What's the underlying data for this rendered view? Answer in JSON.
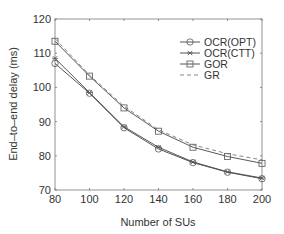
{
  "chart_data": {
    "type": "line",
    "title": "",
    "xlabel": "Number of SUs",
    "ylabel": "End–to–end delay (ms)",
    "x": [
      80,
      100,
      120,
      140,
      160,
      180,
      200
    ],
    "xlim": [
      80,
      200
    ],
    "ylim": [
      70,
      120
    ],
    "xticks": [
      80,
      100,
      120,
      140,
      160,
      180,
      200
    ],
    "yticks": [
      70,
      80,
      90,
      100,
      110,
      120
    ],
    "grid": false,
    "legend_position": "upper right",
    "series": [
      {
        "name": "OCR(OPT)",
        "marker": "circle",
        "dash": "solid",
        "values": [
          107,
          98.3,
          88.2,
          82,
          78,
          75.2,
          73.3
        ]
      },
      {
        "name": "OCR(CTT)",
        "marker": "star",
        "dash": "solid",
        "values": [
          108.5,
          98.5,
          88.5,
          82.5,
          78.2,
          75.3,
          73.5
        ]
      },
      {
        "name": "GOR",
        "marker": "square",
        "dash": "solid",
        "values": [
          113.5,
          103.3,
          94,
          87.2,
          82.5,
          79.8,
          77.8
        ]
      },
      {
        "name": "GR",
        "marker": "none",
        "dash": "dashed",
        "values": [
          114.3,
          103.6,
          94.5,
          87.6,
          83.2,
          80.6,
          78.8
        ]
      }
    ]
  }
}
